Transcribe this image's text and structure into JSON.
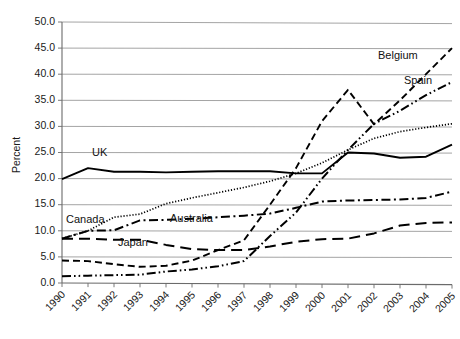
{
  "chart_data": {
    "type": "line",
    "title": "",
    "xlabel": "",
    "ylabel": "Percent",
    "ylim": [
      0,
      50
    ],
    "ytick_step": 5,
    "grid": true,
    "legend": "inline-labels",
    "categories": [
      "1990",
      "1991",
      "1992",
      "1993",
      "1994",
      "1995",
      "1996",
      "1997",
      "1998",
      "1999",
      "2000",
      "2001",
      "2002",
      "2003",
      "2004",
      "2005"
    ],
    "ytick_labels": [
      "0.0",
      "5.0",
      "10.0",
      "15.0",
      "20.0",
      "25.0",
      "30.0",
      "35.0",
      "40.0",
      "45.0",
      "50.0"
    ],
    "series": [
      {
        "name": "UK",
        "style": "solid",
        "values": [
          19.9,
          22.0,
          21.3,
          21.3,
          21.2,
          21.3,
          21.4,
          21.4,
          21.4,
          21.0,
          21.0,
          25.0,
          24.8,
          24.0,
          24.2,
          26.5
        ],
        "label_x": "1991",
        "label_y": 24.3
      },
      {
        "name": "Canada",
        "style": "dotted",
        "values": [
          8.5,
          10.0,
          12.6,
          13.2,
          15.2,
          16.3,
          17.3,
          18.3,
          19.5,
          21.0,
          23.0,
          25.5,
          27.7,
          29.0,
          29.8,
          30.5
        ],
        "label_x": "1990",
        "label_y": 11.5
      },
      {
        "name": "Australia",
        "style": "dashdot",
        "values": [
          8.5,
          10.0,
          10.1,
          12.0,
          12.1,
          12.3,
          12.6,
          12.9,
          13.3,
          14.4,
          15.6,
          15.8,
          15.9,
          16.0,
          16.3,
          17.5
        ],
        "label_x": "1994",
        "label_y": 11.7
      },
      {
        "name": "Japan",
        "style": "longdash",
        "values": [
          8.5,
          8.5,
          8.3,
          8.3,
          7.3,
          6.5,
          6.3,
          6.3,
          7.0,
          7.9,
          8.4,
          8.5,
          9.5,
          11.0,
          11.5,
          11.6
        ],
        "label_x": "1992",
        "label_y": 7.0
      },
      {
        "name": "Belgium",
        "style": "dashed",
        "values": [
          4.3,
          4.2,
          3.6,
          3.1,
          3.3,
          4.3,
          6.3,
          8.2,
          15.0,
          22.0,
          31.0,
          37.0,
          30.4,
          35.0,
          40.0,
          45.0
        ],
        "label_x": "2002",
        "label_y": 43.0
      },
      {
        "name": "Spain",
        "style": "dashdotdot",
        "values": [
          1.3,
          1.4,
          1.5,
          1.6,
          2.2,
          2.6,
          3.2,
          4.2,
          9.0,
          13.5,
          20.0,
          25.5,
          30.5,
          33.0,
          36.0,
          38.5
        ],
        "label_x": "2003",
        "label_y": 38.2
      }
    ]
  }
}
